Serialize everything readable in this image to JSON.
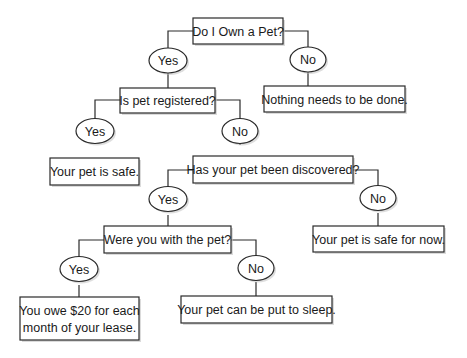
{
  "diagram": {
    "type": "decision-tree",
    "nodes": {
      "q_own_pet": "Do I Own a Pet?",
      "q_own_pet_yes": "Yes",
      "q_own_pet_no": "No",
      "r_nothing": "Nothing needs to be done.",
      "q_registered": "Is pet registered?",
      "q_registered_yes": "Yes",
      "q_registered_no": "No",
      "r_safe": "Your pet is safe.",
      "q_discovered": "Has your pet been discovered?",
      "q_discovered_yes": "Yes",
      "q_discovered_no": "No",
      "r_safe_for_now": "Your pet is safe for now.",
      "q_with_pet": "Were you with the pet?",
      "q_with_pet_yes": "Yes",
      "q_with_pet_no": "No",
      "r_owe_line1": "You owe $20 for each",
      "r_owe_line2": "month of your lease.",
      "r_sleep": "Your pet can be put to sleep."
    },
    "edges": [
      {
        "from": "Do I Own a Pet?",
        "label": "Yes",
        "to": "Is pet registered?"
      },
      {
        "from": "Do I Own a Pet?",
        "label": "No",
        "to": "Nothing needs to be done."
      },
      {
        "from": "Is pet registered?",
        "label": "Yes",
        "to": "Your pet is safe."
      },
      {
        "from": "Is pet registered?",
        "label": "No",
        "to": "Has your pet been discovered?"
      },
      {
        "from": "Has your pet been discovered?",
        "label": "Yes",
        "to": "Were you with the pet?"
      },
      {
        "from": "Has your pet been discovered?",
        "label": "No",
        "to": "Your pet is safe for now."
      },
      {
        "from": "Were you with the pet?",
        "label": "Yes",
        "to": "You owe $20 for each month of your lease."
      },
      {
        "from": "Were you with the pet?",
        "label": "No",
        "to": "Your pet can be put to sleep."
      }
    ]
  }
}
